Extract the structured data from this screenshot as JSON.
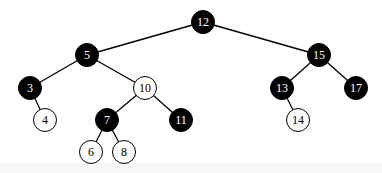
{
  "diagram": {
    "type": "red-black-tree",
    "colors": {
      "black": "#000000",
      "white": "#ffffff",
      "edge": "#000000"
    },
    "nodes": [
      {
        "id": "n12",
        "label": "12",
        "color": "black",
        "x": 203,
        "y": 22
      },
      {
        "id": "n5",
        "label": "5",
        "color": "black",
        "x": 87,
        "y": 55
      },
      {
        "id": "n15",
        "label": "15",
        "color": "black",
        "x": 319,
        "y": 55
      },
      {
        "id": "n3",
        "label": "3",
        "color": "black",
        "x": 30,
        "y": 88
      },
      {
        "id": "n10",
        "label": "10",
        "color": "white",
        "x": 145,
        "y": 88
      },
      {
        "id": "n13",
        "label": "13",
        "color": "black",
        "x": 282,
        "y": 88
      },
      {
        "id": "n17",
        "label": "17",
        "color": "black",
        "x": 356,
        "y": 88
      },
      {
        "id": "n4",
        "label": "4",
        "color": "white",
        "x": 45,
        "y": 120
      },
      {
        "id": "n7",
        "label": "7",
        "color": "black",
        "x": 107,
        "y": 120
      },
      {
        "id": "n11",
        "label": "11",
        "color": "black",
        "x": 181,
        "y": 120
      },
      {
        "id": "n14",
        "label": "14",
        "color": "white",
        "x": 298,
        "y": 120
      },
      {
        "id": "n6",
        "label": "6",
        "color": "white",
        "x": 91,
        "y": 152
      },
      {
        "id": "n8",
        "label": "8",
        "color": "white",
        "x": 124,
        "y": 152
      }
    ],
    "edges": [
      [
        "n12",
        "n5"
      ],
      [
        "n12",
        "n15"
      ],
      [
        "n5",
        "n3"
      ],
      [
        "n5",
        "n10"
      ],
      [
        "n3",
        "n4"
      ],
      [
        "n10",
        "n7"
      ],
      [
        "n10",
        "n11"
      ],
      [
        "n7",
        "n6"
      ],
      [
        "n7",
        "n8"
      ],
      [
        "n15",
        "n13"
      ],
      [
        "n15",
        "n17"
      ],
      [
        "n13",
        "n14"
      ]
    ]
  }
}
